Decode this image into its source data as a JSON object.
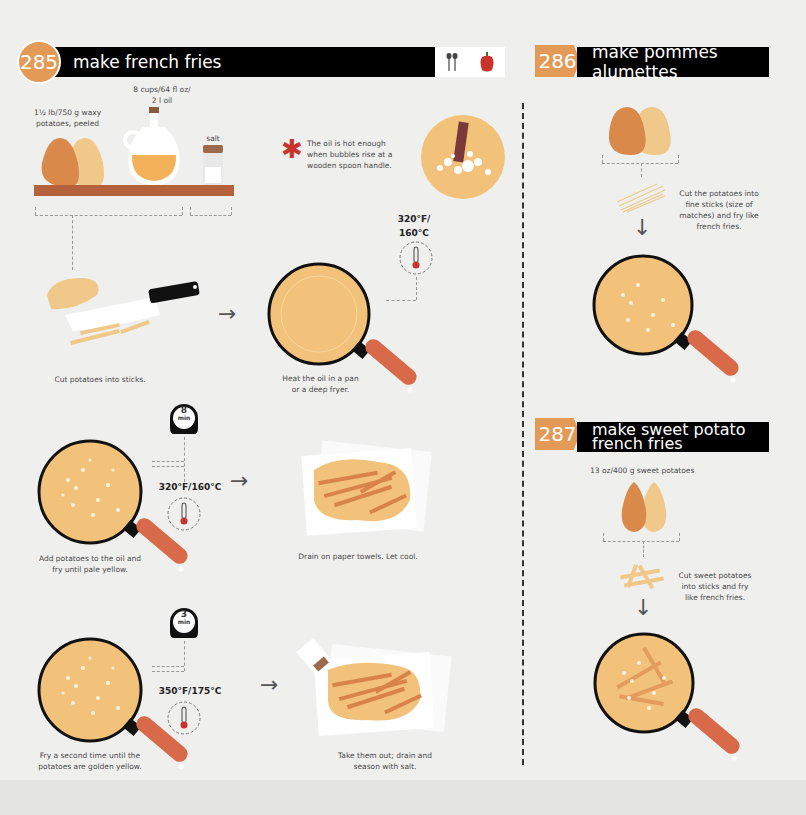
{
  "colors": {
    "background": "#efefee",
    "accent_orange": "#e39a57",
    "header_bar": "#000000",
    "potato_dark": "#d98a4a",
    "potato_light": "#f0c98a",
    "oil": "#f3b25a",
    "shelf": "#b5613c",
    "pan_handle": "#d86a4a",
    "pepper_red": "#c8342b"
  },
  "section_285": {
    "number": "285",
    "title": "make french fries",
    "header_icons": [
      "spoons-icon",
      "pepper-icon"
    ],
    "ingredients": {
      "potatoes": "1½ lb/750 g waxy potatoes, peeled",
      "oil_line1": "8 cups/64 fl oz/",
      "oil_line2": "2 l oil",
      "salt": "salt"
    },
    "tip": {
      "icon": "asterisk-icon",
      "line1": "The oil is hot enough",
      "line2": "when bubbles rise at a",
      "line3": "wooden spoon handle."
    },
    "steps": [
      {
        "text": "Cut potatoes into sticks."
      },
      {
        "line1": "Heat the oil in a pan",
        "line2": "or a deep fryer.",
        "temp_line1": "320°F/",
        "temp_line2": "160°C"
      },
      {
        "line1": "Add potatoes to the oil and",
        "line2": "fry until pale yellow.",
        "timer": "8",
        "timer_unit": "min",
        "temp": "320°F/160°C"
      },
      {
        "text": "Drain on paper towels. Let cool."
      },
      {
        "line1": "Fry a second time until the",
        "line2": "potatoes are golden yellow.",
        "timer": "3",
        "timer_unit": "min",
        "temp": "350°F/175°C"
      },
      {
        "line1": "Take them out; drain and",
        "line2": "season with salt."
      }
    ]
  },
  "section_286": {
    "number": "286",
    "title": "make pommes alumettes",
    "step": {
      "line1": "Cut the potatoes into",
      "line2": "fine sticks (size of",
      "line3": "matches) and fry like",
      "line4": "french fries."
    }
  },
  "section_287": {
    "number": "287",
    "title_line1": "make sweet potato",
    "title_line2": "french fries",
    "ingredient": "13 oz/400 g sweet potatoes",
    "step": {
      "line1": "Cut sweet potatoes",
      "line2": "into sticks and fry",
      "line3": "like french fries."
    }
  }
}
